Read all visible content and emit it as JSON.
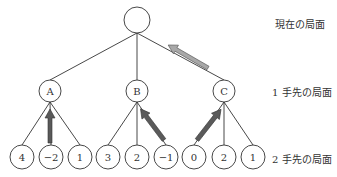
{
  "labels": {
    "current": "現在の局面",
    "one_ahead": "1 手先の局面",
    "two_ahead": "2 手先の局面"
  },
  "root": {
    "label": ""
  },
  "level1": [
    {
      "label": "A"
    },
    {
      "label": "B"
    },
    {
      "label": "C"
    }
  ],
  "level2": [
    {
      "label": "4"
    },
    {
      "label": "−2"
    },
    {
      "label": "1"
    },
    {
      "label": "3"
    },
    {
      "label": "2"
    },
    {
      "label": "−1"
    },
    {
      "label": "0"
    },
    {
      "label": "2"
    },
    {
      "label": "1"
    }
  ],
  "colors": {
    "line": "#333333",
    "arrow_dark": "#5a5a5a",
    "arrow_light": "#a8a8a8"
  }
}
